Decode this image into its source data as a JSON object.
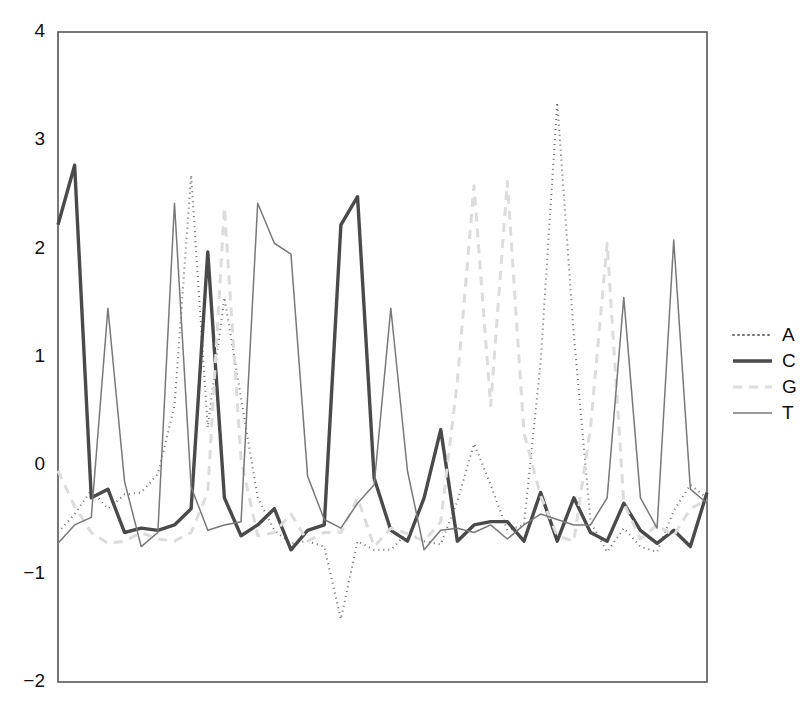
{
  "chart_data": {
    "type": "line",
    "title": "",
    "xlabel": "",
    "ylabel": "",
    "ylim": [
      -2,
      4
    ],
    "xlim": [
      0,
      39
    ],
    "grid": false,
    "legend_position": "right",
    "yticks": [
      -2,
      -1,
      0,
      1,
      2,
      3,
      4
    ],
    "ytick_labels": [
      "−2",
      "−1",
      "0",
      "1",
      "2",
      "3",
      "4"
    ],
    "xticks": [],
    "xtick_labels": [],
    "x": [
      0,
      1,
      2,
      3,
      4,
      5,
      6,
      7,
      8,
      9,
      10,
      11,
      12,
      13,
      14,
      15,
      16,
      17,
      18,
      19,
      20,
      21,
      22,
      23,
      24,
      25,
      26,
      27,
      28,
      29,
      30,
      31,
      32,
      33,
      34,
      35,
      36,
      37,
      38,
      39
    ],
    "series": [
      {
        "name": "A",
        "style": "dotted",
        "color": "#6e6e6e",
        "width": 2.0,
        "dasharray": "1,4",
        "values": [
          -0.62,
          -0.45,
          -0.23,
          -0.4,
          -0.27,
          -0.25,
          -0.08,
          0.55,
          2.68,
          0.35,
          1.55,
          0.62,
          -0.3,
          -0.6,
          -0.72,
          -0.7,
          -0.75,
          -1.42,
          -0.7,
          -0.78,
          -0.78,
          -0.62,
          -0.7,
          -0.73,
          -0.33,
          0.2,
          -0.18,
          -0.6,
          -0.55,
          0.95,
          3.35,
          1.2,
          -0.52,
          -0.8,
          -0.58,
          -0.75,
          -0.8,
          -0.42,
          -0.18,
          -0.3
        ]
      },
      {
        "name": "C",
        "style": "solid-thick",
        "color": "#4a4a4a",
        "width": 3.4,
        "dasharray": "",
        "values": [
          2.22,
          2.77,
          -0.3,
          -0.22,
          -0.62,
          -0.58,
          -0.6,
          -0.55,
          -0.4,
          1.97,
          -0.3,
          -0.65,
          -0.55,
          -0.4,
          -0.78,
          -0.6,
          -0.55,
          2.22,
          2.48,
          -0.12,
          -0.6,
          -0.7,
          -0.3,
          0.33,
          -0.7,
          -0.55,
          -0.52,
          -0.52,
          -0.7,
          -0.25,
          -0.7,
          -0.3,
          -0.62,
          -0.7,
          -0.35,
          -0.6,
          -0.72,
          -0.6,
          -0.75,
          -0.25
        ]
      },
      {
        "name": "G",
        "style": "dashed",
        "color": "#dcdcdc",
        "width": 3.0,
        "dasharray": "9,7",
        "values": [
          -0.05,
          -0.38,
          -0.62,
          -0.72,
          -0.7,
          -0.62,
          -0.68,
          -0.7,
          -0.62,
          -0.25,
          2.38,
          0.05,
          -0.65,
          -0.62,
          -0.45,
          -0.7,
          -0.62,
          -0.62,
          -0.3,
          -0.75,
          -0.58,
          -0.63,
          -0.7,
          -0.52,
          0.78,
          2.58,
          0.55,
          2.62,
          0.3,
          -0.28,
          -0.65,
          -0.7,
          0.35,
          2.05,
          -0.35,
          -0.68,
          -0.55,
          -0.65,
          -0.4,
          -0.32
        ]
      },
      {
        "name": "T",
        "style": "solid-thin",
        "color": "#787878",
        "width": 1.5,
        "dasharray": "",
        "values": [
          -0.72,
          -0.55,
          -0.48,
          1.45,
          -0.15,
          -0.75,
          -0.62,
          2.42,
          -0.2,
          -0.6,
          -0.55,
          -0.52,
          2.42,
          2.05,
          1.95,
          -0.1,
          -0.5,
          -0.58,
          -0.35,
          -0.18,
          1.45,
          -0.05,
          -0.78,
          -0.6,
          -0.58,
          -0.62,
          -0.55,
          -0.68,
          -0.55,
          -0.45,
          -0.5,
          -0.55,
          -0.55,
          -0.3,
          1.55,
          -0.3,
          -0.58,
          2.08,
          -0.22,
          -0.35
        ]
      }
    ],
    "legend_entries": [
      {
        "label": "A",
        "style": "dotted"
      },
      {
        "label": "C",
        "style": "solid-thick"
      },
      {
        "label": "G",
        "style": "dashed"
      },
      {
        "label": "T",
        "style": "solid-thin"
      }
    ],
    "plot_area": {
      "left": 58,
      "top": 32,
      "right": 707,
      "bottom": 682
    },
    "legend_area": {
      "line_x1": 733,
      "line_x2": 772,
      "label_x": 782,
      "y_start": 335,
      "y_step": 26
    }
  }
}
